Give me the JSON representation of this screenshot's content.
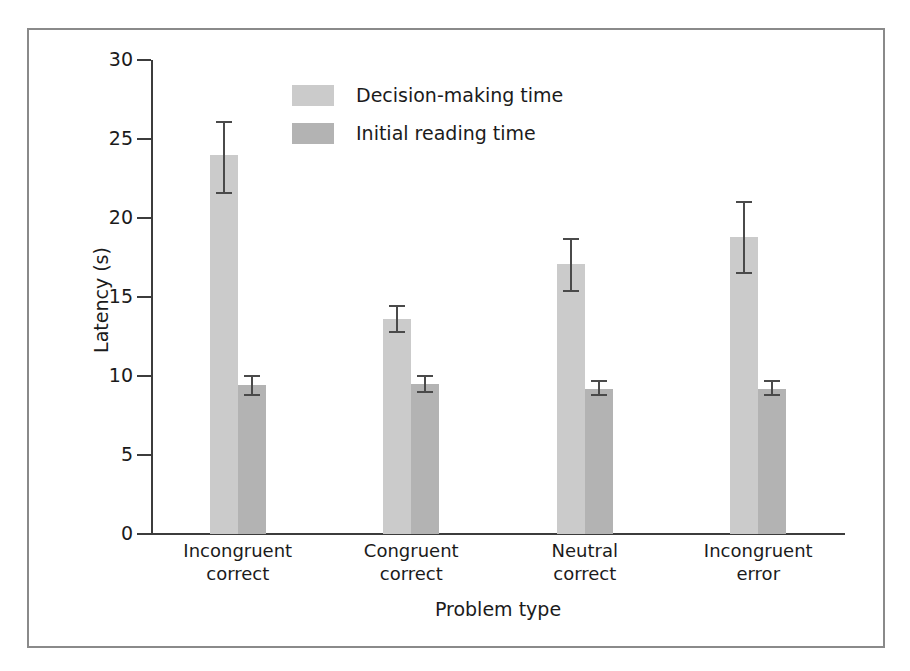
{
  "chart_data": {
    "type": "bar",
    "title": "",
    "xlabel": "Problem type",
    "ylabel": "Latency (s)",
    "ylim": [
      0,
      30
    ],
    "yticks": [
      0,
      5,
      10,
      15,
      20,
      25,
      30
    ],
    "ytick_labels": [
      "0",
      "5",
      "10",
      "15",
      "20",
      "25",
      "30"
    ],
    "grid": false,
    "legend_position": "upper-center",
    "categories": [
      "Incongruent correct",
      "Congruent correct",
      "Neutral correct",
      "Incongruent error"
    ],
    "category_lines": [
      [
        "Incongruent",
        "correct"
      ],
      [
        "Congruent",
        "correct"
      ],
      [
        "Neutral",
        "correct"
      ],
      [
        "Incongruent",
        "error"
      ]
    ],
    "series": [
      {
        "name": "Decision-making time",
        "color": "#cbcbcb",
        "values": [
          24.0,
          13.6,
          17.1,
          18.8
        ],
        "error_low": [
          21.6,
          12.8,
          15.4,
          16.5
        ],
        "error_high": [
          26.1,
          14.4,
          18.7,
          21.0
        ]
      },
      {
        "name": "Initial reading time",
        "color": "#b3b3b3",
        "values": [
          9.4,
          9.5,
          9.2,
          9.2
        ],
        "error_low": [
          8.8,
          9.0,
          8.8,
          8.8
        ],
        "error_high": [
          10.0,
          10.0,
          9.7,
          9.7
        ]
      }
    ]
  },
  "legend": {
    "entries": [
      {
        "label": "Decision-making time",
        "swatch": "light"
      },
      {
        "label": "Initial reading time",
        "swatch": "dark"
      }
    ]
  },
  "axes": {
    "y_title": "Latency (s)",
    "x_title": "Problem type"
  }
}
